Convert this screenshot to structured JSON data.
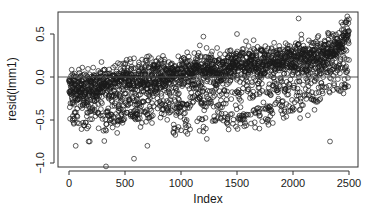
{
  "chart_data": {
    "type": "scatter",
    "title": "",
    "xlabel": "Index",
    "ylabel": "resid(lmm1)",
    "xlim": [
      -60,
      2560
    ],
    "ylim": [
      -1.06,
      0.76
    ],
    "xticks": [
      0,
      500,
      1000,
      1500,
      2000,
      2500
    ],
    "xtick_labels": [
      "0",
      "500",
      "1000",
      "1500",
      "2000",
      "2500"
    ],
    "yticks": [
      -1.0,
      -0.5,
      0.0,
      0.5
    ],
    "ytick_labels": [
      "-1.0",
      "-0.5",
      "0.0",
      "0.5"
    ],
    "grid": false,
    "legend": null,
    "hline": 0.0,
    "marker": "open-circle",
    "n_points": 2500,
    "trend": {
      "main_band": [
        [
          0,
          -0.15
        ],
        [
          500,
          -0.05
        ],
        [
          1000,
          0.05
        ],
        [
          1500,
          0.12
        ],
        [
          2000,
          0.2
        ],
        [
          2300,
          0.28
        ],
        [
          2450,
          0.4
        ],
        [
          2500,
          0.55
        ]
      ],
      "band_spread": 0.2,
      "lower_streaks": [
        [
          [
            300,
            -0.5
          ],
          [
            900,
            -0.35
          ],
          [
            1500,
            -0.2
          ],
          [
            2000,
            -0.1
          ],
          [
            2400,
            0.1
          ]
        ],
        [
          [
            900,
            -0.6
          ],
          [
            1500,
            -0.45
          ],
          [
            2000,
            -0.3
          ],
          [
            2300,
            -0.1
          ],
          [
            2450,
            0.2
          ]
        ],
        [
          [
            1400,
            -0.55
          ],
          [
            1800,
            -0.45
          ],
          [
            2100,
            -0.38
          ],
          [
            2350,
            -0.1
          ]
        ]
      ]
    },
    "outliers": [
      {
        "x": 50,
        "y": -0.42
      },
      {
        "x": 60,
        "y": -0.8
      },
      {
        "x": 175,
        "y": -0.75
      },
      {
        "x": 185,
        "y": -0.75
      },
      {
        "x": 330,
        "y": -1.04
      },
      {
        "x": 580,
        "y": -0.95
      },
      {
        "x": 430,
        "y": -0.65
      },
      {
        "x": 700,
        "y": -0.8
      },
      {
        "x": 1000,
        "y": -0.62
      },
      {
        "x": 1230,
        "y": -0.72
      },
      {
        "x": 1700,
        "y": -0.6
      },
      {
        "x": 2050,
        "y": 0.68
      },
      {
        "x": 2330,
        "y": -0.75
      },
      {
        "x": 2480,
        "y": 0.66
      },
      {
        "x": 1200,
        "y": 0.47
      },
      {
        "x": 1500,
        "y": 0.5
      }
    ]
  },
  "axes": {
    "xlabel": "Index",
    "ylabel": "resid(lmm1)"
  },
  "style": {
    "point_color": "#1a1a1a",
    "axis_color": "#333333",
    "hline_color": "#555555",
    "background": "#ffffff"
  }
}
